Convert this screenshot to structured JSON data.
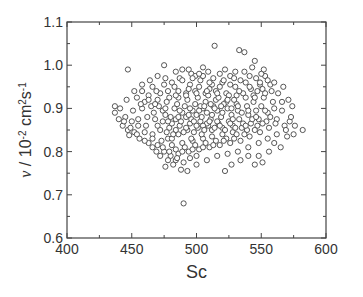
{
  "chart_data": {
    "type": "scatter",
    "title": "",
    "xlabel": "Sc",
    "ylabel": "ν / 10⁻² cm²s⁻¹",
    "ylabel_parts": {
      "symbol": "ν",
      "sep": " / 10",
      "exp1": "-2",
      "unit1": " cm",
      "exp2": "2",
      "unit2": "s",
      "exp3": "-1"
    },
    "xlim": [
      400,
      600
    ],
    "ylim": [
      0.6,
      1.1
    ],
    "xticks": [
      400,
      450,
      500,
      550,
      600
    ],
    "xtick_labels": [
      "400",
      "450",
      "500",
      "550",
      "600"
    ],
    "yticks": [
      0.6,
      0.7,
      0.8,
      0.9,
      1.0,
      1.1
    ],
    "ytick_labels": [
      "0.6",
      "0.7",
      "0.8",
      "0.9",
      "1.0",
      "1.1"
    ],
    "grid": false,
    "legend": null,
    "marker": {
      "shape": "open-circle",
      "stroke": "#444444",
      "fill": "#ffffff",
      "radius": 2.6
    },
    "distribution_summary": {
      "sc_center": 505,
      "nu_center": 0.88,
      "sc_range": [
        435,
        582
      ],
      "nu_range": [
        0.68,
        1.045
      ],
      "approx_count": 1000
    },
    "points": [
      [
        514,
        1.045
      ],
      [
        533,
        1.035
      ],
      [
        537,
        1.03
      ],
      [
        447,
        0.99
      ],
      [
        475,
        1.0
      ],
      [
        489,
        0.99
      ],
      [
        496,
        0.98
      ],
      [
        499,
        0.975
      ],
      [
        505,
        0.995
      ],
      [
        509,
        0.985
      ],
      [
        522,
        0.99
      ],
      [
        545,
        1.01
      ],
      [
        553,
        0.975
      ],
      [
        555,
        0.965
      ],
      [
        549,
        0.955
      ],
      [
        538,
        0.96
      ],
      [
        526,
        0.975
      ],
      [
        487,
        0.97
      ],
      [
        463,
        0.93
      ],
      [
        460,
        0.915
      ],
      [
        437,
        0.905
      ],
      [
        437,
        0.89
      ],
      [
        445,
        0.88
      ],
      [
        443,
        0.86
      ],
      [
        447,
        0.85
      ],
      [
        450,
        0.87
      ],
      [
        455,
        0.86
      ],
      [
        452,
        0.845
      ],
      [
        440,
        0.875
      ],
      [
        448,
        0.838
      ],
      [
        458,
        0.9
      ],
      [
        465,
        0.905
      ],
      [
        470,
        0.92
      ],
      [
        474,
        0.895
      ],
      [
        468,
        0.875
      ],
      [
        461,
        0.86
      ],
      [
        466,
        0.84
      ],
      [
        472,
        0.85
      ],
      [
        478,
        0.83
      ],
      [
        470,
        0.815
      ],
      [
        475,
        0.8
      ],
      [
        480,
        0.79
      ],
      [
        484,
        0.78
      ],
      [
        490,
        0.775
      ],
      [
        495,
        0.785
      ],
      [
        500,
        0.79
      ],
      [
        482,
        0.77
      ],
      [
        476,
        0.765
      ],
      [
        488,
        0.758
      ],
      [
        493,
        0.755
      ],
      [
        490,
        0.68
      ],
      [
        522,
        0.755
      ],
      [
        527,
        0.77
      ],
      [
        534,
        0.78
      ],
      [
        540,
        0.79
      ],
      [
        545,
        0.77
      ],
      [
        551,
        0.775
      ],
      [
        548,
        0.79
      ],
      [
        556,
        0.8
      ],
      [
        560,
        0.82
      ],
      [
        565,
        0.81
      ],
      [
        570,
        0.835
      ],
      [
        575,
        0.84
      ],
      [
        582,
        0.85
      ],
      [
        568,
        0.86
      ],
      [
        572,
        0.87
      ],
      [
        562,
        0.875
      ],
      [
        560,
        0.9
      ],
      [
        566,
        0.915
      ],
      [
        571,
        0.92
      ],
      [
        574,
        0.905
      ],
      [
        563,
        0.935
      ],
      [
        558,
        0.94
      ],
      [
        567,
        0.95
      ],
      [
        552,
        0.925
      ],
      [
        547,
        0.94
      ],
      [
        542,
        0.945
      ],
      [
        530,
        0.95
      ],
      [
        520,
        0.96
      ],
      [
        512,
        0.955
      ],
      [
        503,
        0.965
      ],
      [
        495,
        0.955
      ],
      [
        483,
        0.95
      ],
      [
        478,
        0.94
      ],
      [
        486,
        0.925
      ],
      [
        492,
        0.935
      ],
      [
        499,
        0.94
      ],
      [
        507,
        0.935
      ],
      [
        515,
        0.94
      ],
      [
        523,
        0.935
      ],
      [
        531,
        0.93
      ],
      [
        538,
        0.925
      ],
      [
        544,
        0.915
      ],
      [
        550,
        0.905
      ],
      [
        555,
        0.89
      ],
      [
        548,
        0.875
      ],
      [
        542,
        0.865
      ],
      [
        535,
        0.855
      ],
      [
        528,
        0.845
      ],
      [
        520,
        0.84
      ],
      [
        512,
        0.835
      ],
      [
        505,
        0.83
      ],
      [
        497,
        0.825
      ],
      [
        489,
        0.82
      ],
      [
        481,
        0.815
      ],
      [
        486,
        0.84
      ],
      [
        493,
        0.85
      ],
      [
        501,
        0.855
      ],
      [
        509,
        0.86
      ],
      [
        517,
        0.865
      ],
      [
        525,
        0.87
      ],
      [
        533,
        0.875
      ],
      [
        540,
        0.885
      ],
      [
        546,
        0.895
      ],
      [
        539,
        0.905
      ],
      [
        531,
        0.91
      ],
      [
        523,
        0.915
      ],
      [
        515,
        0.92
      ],
      [
        507,
        0.915
      ],
      [
        499,
        0.91
      ],
      [
        491,
        0.905
      ],
      [
        483,
        0.9
      ],
      [
        476,
        0.885
      ],
      [
        484,
        0.875
      ],
      [
        492,
        0.88
      ],
      [
        500,
        0.885
      ],
      [
        508,
        0.89
      ],
      [
        516,
        0.895
      ],
      [
        524,
        0.9
      ],
      [
        532,
        0.895
      ],
      [
        527,
        0.885
      ],
      [
        519,
        0.88
      ],
      [
        511,
        0.875
      ],
      [
        503,
        0.87
      ],
      [
        495,
        0.865
      ],
      [
        487,
        0.86
      ],
      [
        479,
        0.855
      ],
      [
        474,
        0.87
      ],
      [
        481,
        0.865
      ],
      [
        489,
        0.89
      ],
      [
        497,
        0.895
      ],
      [
        505,
        0.9
      ],
      [
        513,
        0.905
      ],
      [
        521,
        0.91
      ],
      [
        529,
        0.92
      ],
      [
        536,
        0.935
      ],
      [
        544,
        0.93
      ],
      [
        551,
        0.945
      ],
      [
        557,
        0.955
      ],
      [
        541,
        0.975
      ],
      [
        534,
        0.965
      ],
      [
        526,
        0.955
      ],
      [
        518,
        0.95
      ],
      [
        510,
        0.945
      ],
      [
        502,
        0.95
      ],
      [
        494,
        0.945
      ],
      [
        486,
        0.94
      ],
      [
        479,
        0.925
      ],
      [
        472,
        0.935
      ],
      [
        466,
        0.95
      ],
      [
        458,
        0.94
      ],
      [
        454,
        0.925
      ],
      [
        462,
        0.88
      ],
      [
        456,
        0.83
      ],
      [
        463,
        0.82
      ],
      [
        469,
        0.8
      ],
      [
        474,
        0.81
      ],
      [
        479,
        0.8
      ],
      [
        486,
        0.795
      ],
      [
        494,
        0.8
      ],
      [
        502,
        0.805
      ],
      [
        510,
        0.81
      ],
      [
        518,
        0.815
      ],
      [
        526,
        0.82
      ],
      [
        534,
        0.825
      ],
      [
        541,
        0.835
      ],
      [
        549,
        0.845
      ],
      [
        556,
        0.855
      ],
      [
        561,
        0.865
      ],
      [
        554,
        0.87
      ],
      [
        547,
        0.86
      ],
      [
        539,
        0.85
      ],
      [
        531,
        0.84
      ],
      [
        523,
        0.83
      ],
      [
        515,
        0.825
      ],
      [
        507,
        0.82
      ],
      [
        499,
        0.815
      ],
      [
        491,
        0.81
      ],
      [
        484,
        0.805
      ],
      [
        496,
        0.83
      ],
      [
        504,
        0.84
      ],
      [
        512,
        0.85
      ],
      [
        520,
        0.855
      ],
      [
        528,
        0.86
      ],
      [
        536,
        0.865
      ],
      [
        543,
        0.875
      ],
      [
        535,
        0.89
      ],
      [
        527,
        0.9
      ],
      [
        519,
        0.905
      ],
      [
        511,
        0.91
      ],
      [
        503,
        0.905
      ],
      [
        495,
        0.9
      ],
      [
        487,
        0.895
      ],
      [
        480,
        0.88
      ],
      [
        488,
        0.87
      ],
      [
        496,
        0.875
      ],
      [
        504,
        0.88
      ],
      [
        512,
        0.885
      ],
      [
        520,
        0.89
      ],
      [
        528,
        0.875
      ],
      [
        516,
        0.87
      ],
      [
        508,
        0.865
      ],
      [
        500,
        0.86
      ],
      [
        492,
        0.855
      ],
      [
        484,
        0.85
      ],
      [
        477,
        0.845
      ],
      [
        470,
        0.86
      ],
      [
        467,
        0.89
      ],
      [
        471,
        0.905
      ],
      [
        477,
        0.915
      ],
      [
        485,
        0.91
      ],
      [
        493,
        0.92
      ],
      [
        501,
        0.925
      ],
      [
        509,
        0.93
      ],
      [
        517,
        0.925
      ],
      [
        525,
        0.93
      ],
      [
        533,
        0.94
      ],
      [
        541,
        0.95
      ],
      [
        549,
        0.96
      ],
      [
        545,
        0.925
      ],
      [
        553,
        0.935
      ],
      [
        559,
        0.915
      ],
      [
        557,
        0.88
      ],
      [
        551,
        0.865
      ],
      [
        545,
        0.85
      ],
      [
        537,
        0.84
      ],
      [
        529,
        0.83
      ],
      [
        521,
        0.825
      ],
      [
        513,
        0.815
      ],
      [
        505,
        0.81
      ],
      [
        497,
        0.805
      ],
      [
        489,
        0.8
      ],
      [
        481,
        0.83
      ],
      [
        473,
        0.825
      ],
      [
        466,
        0.83
      ],
      [
        460,
        0.845
      ],
      [
        455,
        0.875
      ],
      [
        451,
        0.895
      ],
      [
        457,
        0.91
      ],
      [
        463,
        0.92
      ],
      [
        469,
        0.94
      ],
      [
        475,
        0.955
      ],
      [
        481,
        0.96
      ],
      [
        489,
        0.965
      ],
      [
        497,
        0.97
      ],
      [
        505,
        0.975
      ],
      [
        513,
        0.97
      ],
      [
        521,
        0.965
      ],
      [
        529,
        0.97
      ],
      [
        537,
        0.985
      ],
      [
        543,
        0.995
      ],
      [
        550,
        0.98
      ],
      [
        505,
        0.86
      ],
      [
        498,
        0.87
      ],
      [
        510,
        0.87
      ],
      [
        502,
        0.895
      ],
      [
        514,
        0.9
      ],
      [
        506,
        0.905
      ],
      [
        518,
        0.86
      ],
      [
        526,
        0.865
      ],
      [
        494,
        0.885
      ],
      [
        486,
        0.88
      ],
      [
        478,
        0.87
      ],
      [
        490,
        0.845
      ],
      [
        482,
        0.84
      ],
      [
        498,
        0.845
      ],
      [
        506,
        0.85
      ],
      [
        514,
        0.855
      ],
      [
        522,
        0.85
      ],
      [
        530,
        0.855
      ],
      [
        538,
        0.86
      ],
      [
        546,
        0.88
      ],
      [
        553,
        0.895
      ],
      [
        540,
        0.895
      ],
      [
        532,
        0.905
      ],
      [
        524,
        0.92
      ],
      [
        516,
        0.935
      ],
      [
        508,
        0.94
      ],
      [
        500,
        0.935
      ],
      [
        492,
        0.93
      ],
      [
        484,
        0.93
      ],
      [
        476,
        0.9
      ],
      [
        468,
        0.91
      ],
      [
        500,
        0.77
      ],
      [
        508,
        0.78
      ],
      [
        516,
        0.79
      ],
      [
        524,
        0.795
      ],
      [
        532,
        0.8
      ],
      [
        540,
        0.81
      ],
      [
        548,
        0.82
      ],
      [
        555,
        0.83
      ],
      [
        562,
        0.84
      ],
      [
        569,
        0.85
      ],
      [
        576,
        0.86
      ],
      [
        566,
        0.895
      ],
      [
        573,
        0.88
      ],
      [
        560,
        0.96
      ],
      [
        552,
        0.99
      ],
      [
        546,
        0.97
      ],
      [
        530,
        0.985
      ],
      [
        518,
        0.98
      ],
      [
        510,
        0.96
      ],
      [
        502,
        0.98
      ],
      [
        494,
        0.99
      ],
      [
        484,
        0.985
      ],
      [
        476,
        0.97
      ],
      [
        470,
        0.975
      ],
      [
        464,
        0.965
      ],
      [
        458,
        0.955
      ],
      [
        452,
        0.94
      ],
      [
        446,
        0.92
      ],
      [
        441,
        0.9
      ],
      [
        444,
        0.87
      ],
      [
        449,
        0.855
      ],
      [
        454,
        0.84
      ],
      [
        460,
        0.825
      ],
      [
        466,
        0.81
      ],
      [
        472,
        0.79
      ],
      [
        478,
        0.78
      ],
      [
        485,
        0.785
      ]
    ]
  }
}
